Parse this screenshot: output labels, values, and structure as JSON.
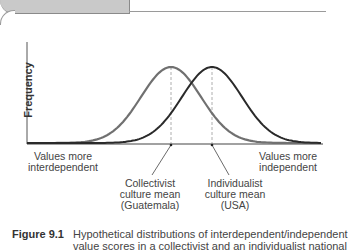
{
  "figure": {
    "number": "Figure 9.1",
    "caption_line1": "Hypothetical distributions of interdependent/independent",
    "caption_line2": "value scores in a collectivist and an individualist national"
  },
  "chart_data": {
    "type": "line",
    "title": "",
    "ylabel": "Frequency",
    "xlabel": "",
    "x_axis_left_label": "Values more interdependent",
    "x_axis_right_label": "Values more independent",
    "grid": false,
    "series": [
      {
        "name": "Collectivist culture (Guatemala)",
        "distribution": "normal",
        "mean_relative": 0.42,
        "color": "#6e6e6e"
      },
      {
        "name": "Individualist culture (USA)",
        "distribution": "normal",
        "mean_relative": 0.58,
        "color": "#2b2b2b"
      }
    ],
    "annotations": [
      {
        "text": "Collectivist culture mean (Guatemala)",
        "points_to": "collectivist mean"
      },
      {
        "text": "Individualist culture mean (USA)",
        "points_to": "individualist mean"
      }
    ]
  },
  "labels": {
    "ylabel": "Frequency",
    "left_l1": "Values more",
    "left_l2": "interdependent",
    "right_l1": "Values more",
    "right_l2": "independent",
    "coll_l1": "Collectivist",
    "coll_l2": "culture mean",
    "coll_l3": "(Guatemala)",
    "ind_l1": "Individualist",
    "ind_l2": "culture mean",
    "ind_l3": "(USA)"
  }
}
